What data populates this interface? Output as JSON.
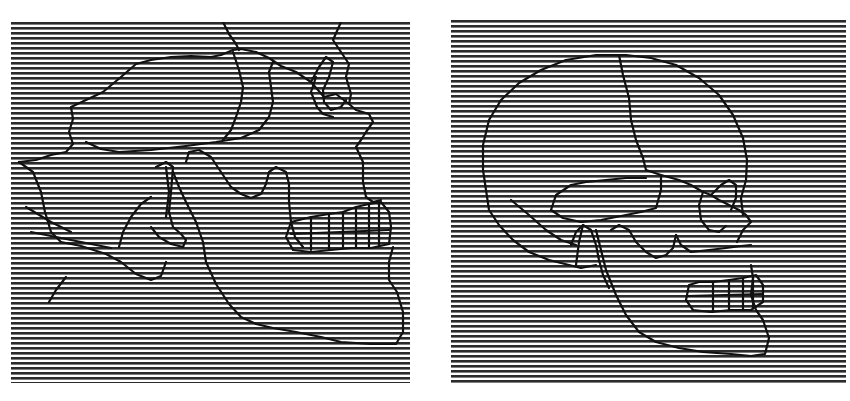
{
  "figure": {
    "width": 850,
    "height": 401,
    "background": "#ffffff"
  },
  "grating": {
    "line_color": "#2b2b2b",
    "period_px": 5,
    "line_thickness_px": 2.6,
    "orientation": "horizontal"
  },
  "outline": {
    "stroke_color": "#111111",
    "stroke_width": 2.2
  },
  "panels": [
    {
      "id": "left",
      "subject": "skull-lateral-view-large-mandible",
      "x": 11,
      "y": 22,
      "width": 399,
      "height": 361,
      "paths": [
        "M 8 140 L 25 138 L 40 133 L 55 130 L 62 122 L 58 110 L 62 97 L 60 85 L 75 78 L 92 70 L 110 55 L 125 42 L 140 38 L 160 35 L 180 34 L 200 35 L 210 33 L 222 28 L 230 27 L 245 30 L 258 36 L 270 44 L 285 50 L 300 60 L 313 75 L 325 72 L 338 82 L 340 72 L 335 55 L 338 42 L 330 30 L 322 18 L 330 0",
        "M 212 0 L 218 12 L 225 22 L 228 28",
        "M 75 120 L 90 127 L 108 130 L 140 128 L 175 124 L 205 120 L 230 116 L 248 108 L 258 95 L 262 80 L 260 65 L 258 50 L 262 40",
        "M 222 30 L 228 48 L 232 65 L 230 80 L 225 95 L 220 108 L 212 118",
        "M 300 60 L 308 45 L 315 35 L 322 40 L 318 55 L 312 68 L 313 80 L 320 88 L 330 85 L 335 78",
        "M 305 55 L 300 70 L 306 85 L 312 92 L 322 95",
        "M 338 82 L 345 88 L 358 92 L 362 100 L 355 110 L 350 118 L 345 125 L 352 140 L 352 160 L 355 175 L 362 180 L 370 178",
        "M 8 140 L 22 150 L 30 170 L 34 190 L 40 210 L 50 220 L 70 224 L 95 232 L 110 240 L 125 252 L 140 258 L 150 254 L 155 240",
        "M 15 185 L 40 200 L 60 210",
        "M 20 210 L 45 215 L 80 222 L 100 226",
        "M 145 145 L 155 140 L 162 145 L 160 170 L 158 190 L 162 205 L 170 212 L 175 218 L 172 225 L 160 222 L 148 215 L 140 205",
        "M 155 145 L 158 170 L 155 195",
        "M 175 140 L 178 130 L 188 128 L 200 135 L 210 150 L 220 165 L 230 172 L 240 176 L 250 172 L 255 162 L 258 150 L 265 145 L 275 150 L 278 162 L 278 180 L 280 200 L 284 215 L 292 225",
        "M 162 150 L 168 165 L 175 180 L 185 200 L 192 220 L 195 240 L 205 262 L 218 282 L 230 295 L 245 302 L 262 306 L 285 310 L 310 315 L 330 320 L 360 322 L 385 322 L 392 310 L 392 290 L 386 270 L 378 258 L 378 240 L 382 225",
        "M 280 200 L 275 215 L 282 228 L 300 230 L 320 228 L 340 226 L 360 226 L 378 222 L 380 205 L 378 190 L 370 180 L 358 182 L 345 185 L 332 190 L 318 192 L 300 195 L 288 198 Z",
        "M 300 195 L 300 228 M 318 192 L 318 228 M 332 190 L 332 226 M 345 185 L 345 226 M 358 182 L 358 226 M 368 180 L 368 224",
        "M 280 212 L 378 208",
        "M 140 175 L 130 182 L 120 195 L 112 210 L 108 225",
        "M 55 255 L 45 268 L 38 280"
      ]
    },
    {
      "id": "right",
      "subject": "skull-lateral-view-large-cranium",
      "x": 451,
      "y": 20,
      "width": 395,
      "height": 364,
      "paths": [
        "M 35 170 L 32 150 L 32 125 L 38 100 L 50 80 L 68 63 L 90 50 L 115 40 L 145 35 L 175 35 L 200 38 L 225 45 L 248 58 L 268 75 L 282 95 L 292 118 L 296 140 L 295 160 L 290 178 L 292 195",
        "M 168 35 L 172 55 L 178 78 L 180 100 L 185 120 L 192 138 L 195 150",
        "M 35 170 L 38 190 L 48 205 L 62 220 L 78 232 L 98 240 L 118 245 L 130 248 L 145 245",
        "M 60 180 L 78 195 L 95 210 L 110 220 L 125 225",
        "M 195 150 L 210 155 L 228 160 L 240 165 L 252 172 L 260 175 L 268 180 L 278 185 L 288 190 L 295 195 L 300 202 L 292 210 L 286 222",
        "M 100 190 L 105 175 L 120 165 L 135 162 L 155 160 L 175 158 L 195 158",
        "M 100 190 L 112 198 L 130 202 L 150 200 L 170 196 L 190 192 L 205 188 L 210 170 L 210 155",
        "M 260 175 L 270 165 L 278 160 L 285 165 L 285 178 L 280 190",
        "M 252 172 L 248 185 L 250 200 L 258 210 L 268 212 L 275 206",
        "M 120 225 L 125 212 L 132 205 L 140 210 L 145 225 L 148 240 L 152 255 L 158 268",
        "M 160 210 L 168 205 L 178 210 L 185 222 L 195 232 L 205 238 L 215 235 L 222 228 L 225 215",
        "M 132 205 L 128 222 L 125 245",
        "M 145 210 L 150 230 L 155 250 L 165 275 L 175 295 L 188 312 L 205 322 L 228 328 L 252 332 L 280 334 L 300 336 L 314 334 L 318 318 L 312 300 L 305 290 L 300 275 L 302 258 L 300 245",
        "M 225 215 L 230 225 L 240 232 L 258 230 L 275 228 L 290 226 L 300 225",
        "M 238 265 L 235 280 L 242 290 L 260 292 L 280 290 L 300 290 L 312 282 L 312 265 L 305 255 L 292 258 L 278 260 L 262 262 L 248 262 Z",
        "M 262 262 L 262 292 M 278 260 L 278 290 M 292 258 L 292 290 M 302 256 L 302 288",
        "M 236 276 L 312 274"
      ]
    }
  ]
}
